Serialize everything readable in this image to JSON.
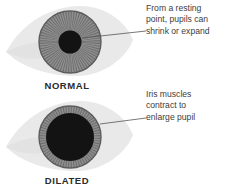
{
  "figure": {
    "background_color": "#ffffff"
  },
  "colors": {
    "sclera": "#e9e9e9",
    "sclera_shadow": "#dedede",
    "iris_dark": "#6d6d6d",
    "iris_light": "#8f8f8f",
    "pupil": "#131313",
    "label_text": "#2b2b2b",
    "annotation_text": "#3d3d3d",
    "leader_line": "#555555"
  },
  "eyes": [
    {
      "id": "eye-normal",
      "label": "NORMAL",
      "state": "normal",
      "pupil_diameter_px": 23,
      "iris_diameter_px": 62,
      "center_x": 70,
      "center_y": 42
    },
    {
      "id": "eye-dilated",
      "label": "DILATED",
      "state": "dilated",
      "pupil_diameter_px": 48,
      "iris_diameter_px": 62,
      "center_x": 70,
      "center_y": 137
    }
  ],
  "annotations": [
    {
      "id": "annotation-top",
      "target": "pupil-normal",
      "lines": [
        "From a resting",
        "point, pupils can",
        "shrink or expand"
      ]
    },
    {
      "id": "annotation-bottom",
      "target": "iris-dilated",
      "lines": [
        "Iris muscles",
        "contract to",
        "enlarge pupil"
      ]
    }
  ]
}
